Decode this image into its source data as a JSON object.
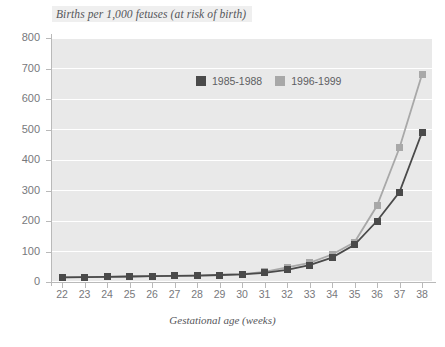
{
  "chart_data": {
    "type": "line",
    "title": "Births per 1,000 fetuses (at risk of birth)",
    "xlabel": "Gestational age (weeks)",
    "ylabel": "",
    "categories": [
      22,
      23,
      24,
      25,
      26,
      27,
      28,
      29,
      30,
      31,
      32,
      33,
      34,
      35,
      36,
      37,
      38
    ],
    "x": [
      22,
      23,
      24,
      25,
      26,
      27,
      28,
      29,
      30,
      31,
      32,
      33,
      34,
      35,
      36,
      37,
      38
    ],
    "xlim": [
      22,
      38
    ],
    "ylim": [
      0,
      800
    ],
    "yticks": [
      0,
      100,
      200,
      300,
      400,
      500,
      600,
      700,
      800
    ],
    "xticks": [
      22,
      23,
      24,
      25,
      26,
      27,
      28,
      29,
      30,
      31,
      32,
      33,
      34,
      35,
      36,
      37,
      38
    ],
    "grid": true,
    "legend_position": "top-center",
    "series": [
      {
        "name": "1985-1988",
        "color": "#4a4a4a",
        "marker": "square",
        "values": [
          15,
          16,
          17,
          18,
          19,
          20,
          21,
          23,
          25,
          30,
          40,
          55,
          80,
          122,
          200,
          295,
          490
        ]
      },
      {
        "name": "1996-1999",
        "color": "#a8a8a8",
        "marker": "square",
        "values": [
          15,
          16,
          17,
          18,
          19,
          20,
          21,
          23,
          26,
          33,
          48,
          63,
          90,
          130,
          250,
          440,
          680
        ]
      }
    ]
  },
  "legend": {
    "items": [
      {
        "label": "1985-1988",
        "color": "#4a4a4a"
      },
      {
        "label": "1996-1999",
        "color": "#a8a8a8"
      }
    ]
  },
  "axes": {
    "y_tick_labels": [
      "800",
      "700",
      "600",
      "500",
      "400",
      "300",
      "200",
      "100",
      "0"
    ],
    "x_tick_labels": [
      "22",
      "23",
      "24",
      "25",
      "26",
      "27",
      "28",
      "29",
      "30",
      "31",
      "32",
      "33",
      "34",
      "35",
      "36",
      "37",
      "38"
    ]
  },
  "colors": {
    "plot_background": "#e9e9e9",
    "gridline": "#ffffff",
    "axis": "#b9b9b9",
    "text": "#77787c",
    "title_text": "#55565a",
    "series_dark": "#4a4a4a",
    "series_light": "#a8a8a8"
  }
}
